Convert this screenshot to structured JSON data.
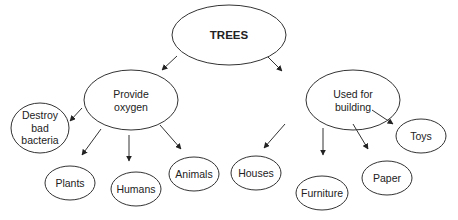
{
  "diagram": {
    "type": "concept-map",
    "root": {
      "id": "trees",
      "label": "TREES",
      "cx": 229,
      "cy": 35,
      "rx": 57,
      "ry": 30
    },
    "nodes": [
      {
        "id": "provide-oxygen",
        "label": "Provide\noxygen",
        "parent": "trees",
        "cx": 131,
        "cy": 100,
        "rx": 47,
        "ry": 30
      },
      {
        "id": "used-for-building",
        "label": "Used for\nbuilding",
        "parent": "trees",
        "cx": 353,
        "cy": 100,
        "rx": 47,
        "ry": 30
      },
      {
        "id": "destroy-bad-bacteria",
        "label": "Destroy\nbad\nbacteria",
        "parent": "provide-oxygen",
        "cx": 40,
        "cy": 128,
        "rx": 29,
        "ry": 25
      },
      {
        "id": "plants",
        "label": "Plants",
        "parent": "provide-oxygen",
        "cx": 70,
        "cy": 183,
        "rx": 25,
        "ry": 17
      },
      {
        "id": "humans",
        "label": "Humans",
        "parent": "provide-oxygen",
        "cx": 136,
        "cy": 189,
        "rx": 25,
        "ry": 17
      },
      {
        "id": "animals",
        "label": "Animals",
        "parent": "provide-oxygen",
        "cx": 194,
        "cy": 174,
        "rx": 25,
        "ry": 17
      },
      {
        "id": "houses",
        "label": "Houses",
        "parent": "used-for-building",
        "cx": 256,
        "cy": 173,
        "rx": 25,
        "ry": 17
      },
      {
        "id": "furniture",
        "label": "Furniture",
        "parent": "used-for-building",
        "cx": 322,
        "cy": 193,
        "rx": 26,
        "ry": 17
      },
      {
        "id": "paper",
        "label": "Paper",
        "parent": "used-for-building",
        "cx": 387,
        "cy": 178,
        "rx": 25,
        "ry": 17
      },
      {
        "id": "toys",
        "label": "Toys",
        "parent": "used-for-building",
        "cx": 421,
        "cy": 136,
        "rx": 25,
        "ry": 17
      }
    ],
    "arrows": [
      {
        "from": "trees",
        "to": "provide-oxygen",
        "x1": 177,
        "y1": 56,
        "x2": 162,
        "y2": 70
      },
      {
        "from": "trees",
        "to": "used-for-building",
        "x1": 268,
        "y1": 57,
        "x2": 282,
        "y2": 71
      },
      {
        "from": "provide-oxygen",
        "to": "destroy-bad-bacteria",
        "x1": 82,
        "y1": 108,
        "x2": 70,
        "y2": 121
      },
      {
        "from": "provide-oxygen",
        "to": "plants",
        "x1": 101,
        "y1": 129,
        "x2": 82,
        "y2": 155
      },
      {
        "from": "provide-oxygen",
        "to": "humans",
        "x1": 129,
        "y1": 135,
        "x2": 129,
        "y2": 161
      },
      {
        "from": "provide-oxygen",
        "to": "animals",
        "x1": 160,
        "y1": 125,
        "x2": 181,
        "y2": 149
      },
      {
        "from": "used-for-building",
        "to": "houses",
        "x1": 285,
        "y1": 124,
        "x2": 264,
        "y2": 148
      },
      {
        "from": "used-for-building",
        "to": "furniture",
        "x1": 323,
        "y1": 128,
        "x2": 323,
        "y2": 155
      },
      {
        "from": "used-for-building",
        "to": "paper",
        "x1": 353,
        "y1": 124,
        "x2": 368,
        "y2": 149
      },
      {
        "from": "used-for-building",
        "to": "toys",
        "x1": 372,
        "y1": 110,
        "x2": 393,
        "y2": 124
      }
    ],
    "colors": {
      "stroke": "#333333",
      "text": "#222222",
      "background": "#ffffff"
    }
  }
}
